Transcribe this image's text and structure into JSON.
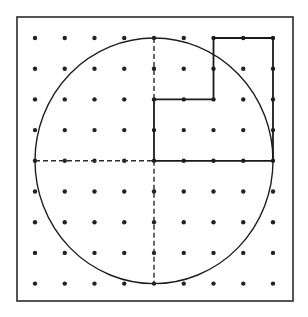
{
  "figure": {
    "grid": {
      "columns": 9,
      "rows": 9,
      "origin_x": 35,
      "origin_y": 38,
      "step_x": 29.75,
      "step_y": 30.7
    },
    "frame": {
      "x": 17,
      "y": 17,
      "width": 276,
      "height": 284
    },
    "circle": {
      "center_grid": [
        4,
        4
      ],
      "radius_units": 4
    },
    "dashed_lines": [
      {
        "name": "horizontal-diameter-left",
        "from": [
          0,
          4
        ],
        "to": [
          4,
          4
        ]
      },
      {
        "name": "vertical-diameter-bottom",
        "from": [
          4,
          4
        ],
        "to": [
          4,
          8
        ]
      },
      {
        "name": "vertical-diameter-top",
        "from": [
          4,
          0
        ],
        "to": [
          4,
          2
        ]
      }
    ],
    "solid_polygon": {
      "name": "rectilinear-shape",
      "vertices_grid": [
        [
          4,
          4
        ],
        [
          4,
          2
        ],
        [
          6,
          2
        ],
        [
          6,
          0
        ],
        [
          8,
          0
        ],
        [
          8,
          4
        ]
      ]
    },
    "colors": {
      "line": "#1e1e1e",
      "dot": "#222222",
      "background": "#ffffff"
    }
  }
}
